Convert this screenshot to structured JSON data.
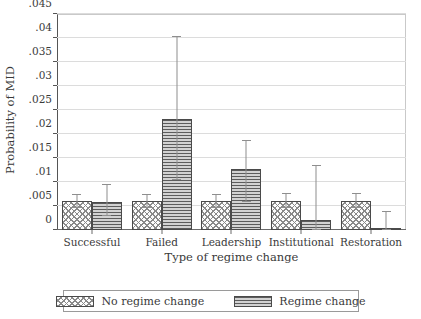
{
  "chart_data": {
    "type": "bar",
    "title": "",
    "xlabel": "Type of regime change",
    "ylabel": "Probability of MID",
    "ylim": [
      0,
      0.045
    ],
    "yticks": [
      0,
      0.005,
      0.01,
      0.015,
      0.02,
      0.025,
      0.03,
      0.035,
      0.04,
      0.045
    ],
    "ytick_labels": [
      "0",
      ".005",
      ".01",
      ".015",
      ".02",
      ".025",
      ".03",
      ".035",
      ".04",
      ".045"
    ],
    "grid": true,
    "legend_position": "bottom",
    "categories": [
      "Successful",
      "Failed",
      "Leadership",
      "Institutional",
      "Restoration"
    ],
    "series": [
      {
        "name": "No regime change",
        "pattern": "cross-hatch",
        "values": [
          0.006,
          0.006,
          0.006,
          0.006,
          0.006
        ],
        "ci_low": [
          0.0045,
          0.0045,
          0.0045,
          0.0045,
          0.0045
        ],
        "ci_high": [
          0.0075,
          0.0075,
          0.0075,
          0.0077,
          0.0078
        ]
      },
      {
        "name": "Regime change",
        "pattern": "horizontal-lines",
        "values": [
          0.0058,
          0.0232,
          0.0128,
          0.0021,
          0.0005
        ],
        "ci_low": [
          0.003,
          0.0105,
          0.0058,
          0.0,
          0.0
        ],
        "ci_high": [
          0.0095,
          0.0405,
          0.0188,
          0.0135,
          0.004
        ]
      }
    ]
  },
  "legend": {
    "items": [
      {
        "label": "No regime change"
      },
      {
        "label": "Regime change"
      }
    ]
  }
}
